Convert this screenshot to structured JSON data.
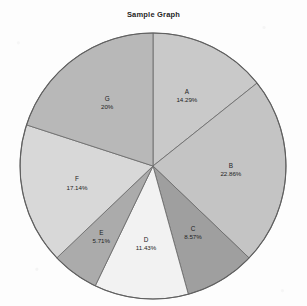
{
  "chart_data": {
    "type": "pie",
    "title": "Sample Graph",
    "categories": [
      "A",
      "B",
      "C",
      "D",
      "E",
      "F",
      "G"
    ],
    "values": [
      14.29,
      22.86,
      8.57,
      11.43,
      5.71,
      17.14,
      20
    ],
    "value_unit": "%",
    "labels": [
      {
        "name": "A",
        "percent": "14.29%"
      },
      {
        "name": "B",
        "percent": "22.86%"
      },
      {
        "name": "C",
        "percent": "8.57%"
      },
      {
        "name": "D",
        "percent": "11.43%"
      },
      {
        "name": "E",
        "percent": "5.71%"
      },
      {
        "name": "F",
        "percent": "17.14%"
      },
      {
        "name": "G",
        "percent": "20%"
      }
    ],
    "slice_colors": [
      "#c9c9c9",
      "#c4c4c4",
      "#9f9f9f",
      "#f2f2f2",
      "#ababab",
      "#d8d8d8",
      "#b8b8b8"
    ],
    "stroke_color": "#6e6e6e",
    "start_angle_deg": 0,
    "direction": "clockwise",
    "legend": "none",
    "xlabel": "",
    "ylabel": "",
    "background": "#fdfdfd"
  }
}
